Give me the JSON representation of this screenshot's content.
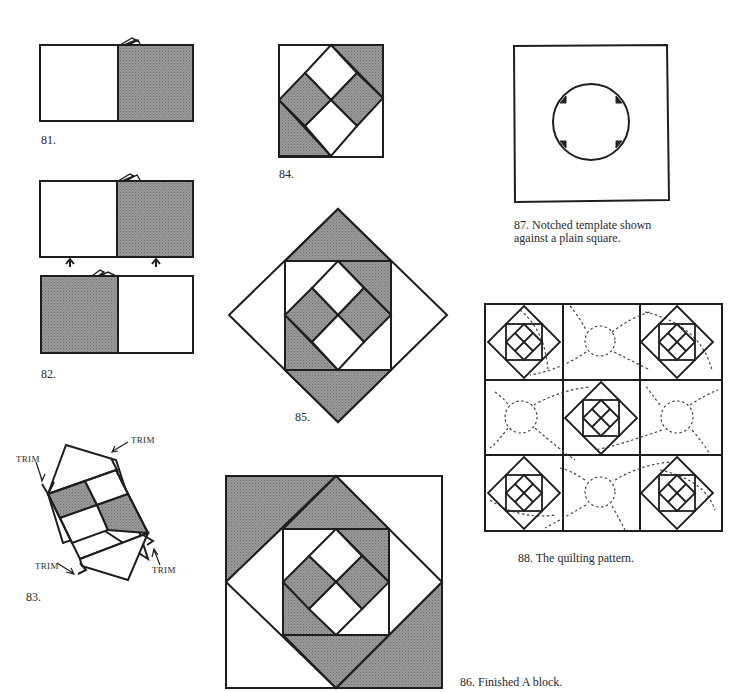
{
  "figures": [
    {
      "id": "81",
      "caption": "81."
    },
    {
      "id": "82",
      "caption": "82."
    },
    {
      "id": "83",
      "caption": "83.",
      "annotations": [
        "TRIM",
        "TRIM",
        "TRIM",
        "TRIM"
      ]
    },
    {
      "id": "84",
      "caption": "84."
    },
    {
      "id": "85",
      "caption": "85."
    },
    {
      "id": "86",
      "caption": "86. Finished A block."
    },
    {
      "id": "87",
      "caption_line1": "87. Notched template shown",
      "caption_line2": "against a plain square."
    },
    {
      "id": "88",
      "caption": "88. The quilting pattern."
    }
  ],
  "colors": {
    "ink": "#1e1e1e",
    "shade": "#8a8a8a",
    "paper": "#ffffff"
  }
}
